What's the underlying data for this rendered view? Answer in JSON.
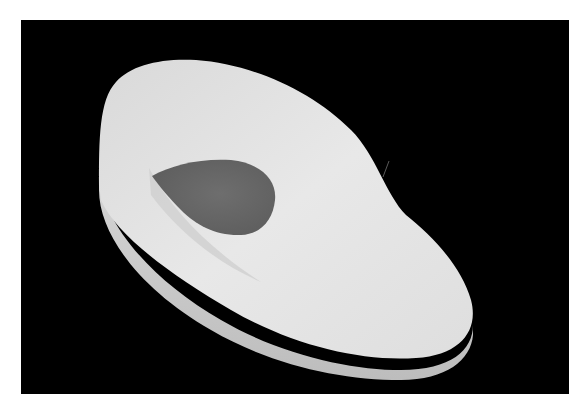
{
  "image": {
    "subject": "silicone heel insole",
    "alt": "White silicone insole with dark grey teardrop heel pad on black background",
    "colors": {
      "background": "#000000",
      "border": "#ffffff",
      "insole": "#e4e4e4",
      "insole_shadow": "#c8c8c8",
      "heel_pad": "#6a6a6a"
    }
  }
}
